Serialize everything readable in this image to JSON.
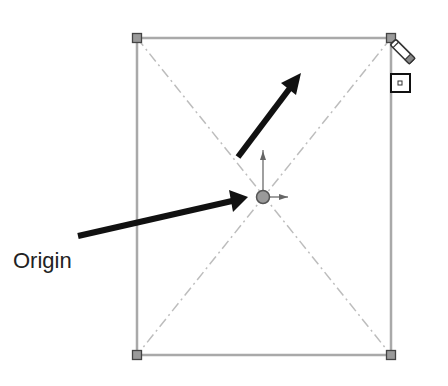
{
  "diagram": {
    "labels": {
      "origin": "Origin"
    },
    "rectangle": {
      "corners": [
        {
          "name": "top-left",
          "x": 137,
          "y": 38
        },
        {
          "name": "top-right",
          "x": 391,
          "y": 38
        },
        {
          "name": "bottom-right",
          "x": 391,
          "y": 355
        },
        {
          "name": "bottom-left",
          "x": 137,
          "y": 355
        }
      ],
      "edge_color": "#a9a9a9",
      "diagonal_color": "#b8b8b8",
      "corner_fill": "#9a9a9a",
      "corner_stroke": "#444444"
    },
    "origin_point": {
      "x": 263,
      "y": 197,
      "fill": "#9a9a9a"
    },
    "arrows": [
      {
        "name": "arrow-to-origin",
        "from": [
          78,
          236
        ],
        "to": [
          246,
          198
        ],
        "color": "#111111"
      },
      {
        "name": "arrow-up-right",
        "from": [
          238,
          156
        ],
        "to": [
          301,
          74
        ],
        "color": "#111111"
      }
    ],
    "cursor": {
      "icon": "pencil-icon",
      "x": 391,
      "y": 38
    },
    "inference_box": {
      "x": 391,
      "y": 74,
      "w": 19,
      "h": 18
    }
  }
}
